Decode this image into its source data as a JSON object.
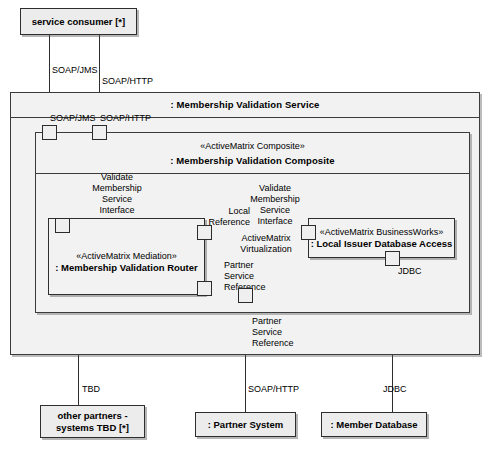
{
  "diagram": {
    "type": "uml-component-diagram",
    "colors": {
      "container_fill": "#f2f2f2",
      "node_fill": "#ececec",
      "stroke": "#2e2e2e",
      "shadow": "rgba(80,80,80,0.4)",
      "text": "#000000"
    }
  },
  "nodes": {
    "service_consumer": {
      "label": "service consumer [*]"
    },
    "membership_validation_service": {
      "label": ": Membership Validation Service"
    },
    "membership_validation_composite": {
      "stereotype": "«ActiveMatrix Composite»",
      "label": ": Membership Validation Composite"
    },
    "membership_validation_router": {
      "stereotype": "«ActiveMatrix Mediation»",
      "label": ": Membership Validation Router"
    },
    "local_issuer_database_access": {
      "stereotype": "«ActiveMatrix BusinessWorks»",
      "label": ": Local Issuer Database Access"
    },
    "other_partners": {
      "line1": "other partners -",
      "line2": "systems TBD [*]"
    },
    "partner_system": {
      "label": ": Partner System"
    },
    "member_database": {
      "label": ": Member Database"
    }
  },
  "connector_labels": {
    "soap_jms_outer": "SOAP/JMS",
    "soap_http_outer": "SOAP/HTTP",
    "soap_jms_inner": "SOAP/JMS",
    "soap_http_inner": "SOAP/HTTP",
    "validate_membership_service_interface_left": "Validate\nMembership\nService\nInterface",
    "validate_membership_service_interface_right": "Validate\nMembership\nService\nInterface",
    "local_reference": "Local\nReference",
    "activematrix_virtualization": "ActiveMatrix\nVirtualization",
    "partner_service_reference_inner": "Partner\nService\nReference",
    "partner_service_reference_outer": "Partner\nService\nReference",
    "jdbc_inner": "JDBC",
    "jdbc_outer": "JDBC",
    "tbd": "TBD",
    "soap_http_partner": "SOAP/HTTP"
  },
  "ports": {
    "composite_soap_jms": "port-composite-soap-jms",
    "composite_soap_http": "port-composite-soap-http",
    "router_service_interface": "port-router-validate-membership-service-interface",
    "router_local_reference": "port-router-local-reference",
    "router_partner_service_reference": "port-router-partner-service-reference",
    "bw_service_interface": "port-businessworks-validate-membership-service-interface",
    "bw_jdbc": "port-businessworks-jdbc",
    "composite_partner_service_reference": "port-composite-partner-service-reference"
  }
}
